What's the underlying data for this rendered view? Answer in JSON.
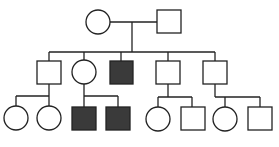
{
  "diagram": {
    "type": "pedigree",
    "stroke": "#222222",
    "fill_affected": "#3a3a3a",
    "fill_unaffected": "#ffffff",
    "generations": [
      {
        "gen": "I",
        "members": [
          {
            "id": "I-1",
            "sex": "female",
            "affected": false
          },
          {
            "id": "I-2",
            "sex": "male",
            "affected": false
          }
        ]
      },
      {
        "gen": "II",
        "members": [
          {
            "id": "II-1",
            "sex": "male",
            "affected": false
          },
          {
            "id": "II-2",
            "sex": "female",
            "affected": false
          },
          {
            "id": "II-3",
            "sex": "male",
            "affected": true
          },
          {
            "id": "II-4",
            "sex": "male",
            "affected": false
          },
          {
            "id": "II-5",
            "sex": "male",
            "affected": false
          }
        ]
      },
      {
        "gen": "III",
        "members": [
          {
            "id": "III-1",
            "sex": "female",
            "affected": false,
            "parent": "II-1"
          },
          {
            "id": "III-2",
            "sex": "female",
            "affected": false,
            "parent": "II-1"
          },
          {
            "id": "III-3",
            "sex": "male",
            "affected": true,
            "parent": "II-2"
          },
          {
            "id": "III-4",
            "sex": "male",
            "affected": true,
            "parent": "II-2"
          },
          {
            "id": "III-5",
            "sex": "female",
            "affected": false,
            "parent": "II-4"
          },
          {
            "id": "III-6",
            "sex": "male",
            "affected": false,
            "parent": "II-4"
          },
          {
            "id": "III-7",
            "sex": "female",
            "affected": false,
            "parent": "II-5"
          },
          {
            "id": "III-8",
            "sex": "male",
            "affected": false,
            "parent": "II-5"
          }
        ]
      }
    ]
  }
}
